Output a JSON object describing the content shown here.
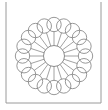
{
  "figure": {
    "type": "line-drawing",
    "caption": ""
  },
  "canvas": {
    "width": 108,
    "height": 110,
    "background_color": "#ffffff"
  },
  "frame": {
    "name": "page-border",
    "stroke_color": "#9a9a9a",
    "stroke_width": 1,
    "left_x": 6,
    "right_x": 101,
    "top_y": 2,
    "bottom_y": 103,
    "visible_edges": [
      "left",
      "bottom",
      "right"
    ]
  },
  "rosette": {
    "center_x": 54,
    "center_y": 56,
    "hub_radius": 10.5,
    "petal_count": 20,
    "petal_circle_radius": 7.2,
    "petal_ring_radius": 31.5,
    "spoke_inner_radius": 10.5,
    "spoke_outer_radius": 24.5,
    "stroke_color": "#7d7d7d",
    "hub_stroke_color": "#6e6e6e",
    "spoke_stroke_color": "#8a8a8a",
    "stroke_width": 0.8,
    "fill": "none",
    "start_angle_deg": -90
  },
  "colors": {
    "line": "#7d7d7d",
    "line_dark": "#6e6e6e",
    "line_light": "#9a9a9a",
    "background": "#ffffff"
  }
}
